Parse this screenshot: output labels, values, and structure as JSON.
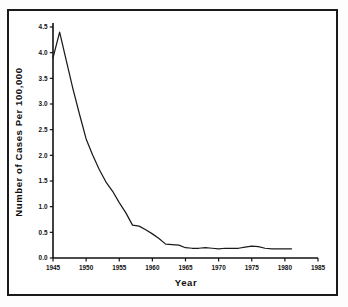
{
  "chart_data": {
    "type": "line",
    "title": "",
    "xlabel": "Year",
    "ylabel": "Number of Cases Per 100,000",
    "xlim": [
      1945,
      1985
    ],
    "ylim": [
      0.0,
      4.5
    ],
    "grid": false,
    "legend": "none",
    "xticks": [
      "1945",
      "1950",
      "1955",
      "1960",
      "1965",
      "1970",
      "1975",
      "1980",
      "1985"
    ],
    "xtick_values": [
      1945,
      1950,
      1955,
      1960,
      1965,
      1970,
      1975,
      1980,
      1985
    ],
    "yticks": [
      "0.0",
      "0.5",
      "1.0",
      "1.5",
      "2.0",
      "2.5",
      "3.0",
      "3.5",
      "4.0",
      "4.5"
    ],
    "ytick_values": [
      0.0,
      0.5,
      1.0,
      1.5,
      2.0,
      2.5,
      3.0,
      3.5,
      4.0,
      4.5
    ],
    "series": [
      {
        "name": "Cases per 100,000",
        "color": "#1b1b1b",
        "x": [
          1945,
          1946,
          1947,
          1948,
          1949,
          1950,
          1951,
          1952,
          1953,
          1954,
          1955,
          1956,
          1957,
          1958,
          1959,
          1960,
          1961,
          1962,
          1963,
          1964,
          1965,
          1966,
          1967,
          1968,
          1969,
          1970,
          1971,
          1972,
          1973,
          1974,
          1975,
          1976,
          1977,
          1978,
          1979,
          1980,
          1981
        ],
        "values": [
          3.9,
          4.4,
          3.85,
          3.3,
          2.8,
          2.32,
          2.0,
          1.72,
          1.48,
          1.3,
          1.08,
          0.88,
          0.64,
          0.62,
          0.55,
          0.47,
          0.38,
          0.27,
          0.26,
          0.25,
          0.2,
          0.19,
          0.19,
          0.2,
          0.19,
          0.18,
          0.19,
          0.19,
          0.19,
          0.21,
          0.23,
          0.22,
          0.19,
          0.18,
          0.18,
          0.18,
          0.18
        ]
      }
    ]
  }
}
